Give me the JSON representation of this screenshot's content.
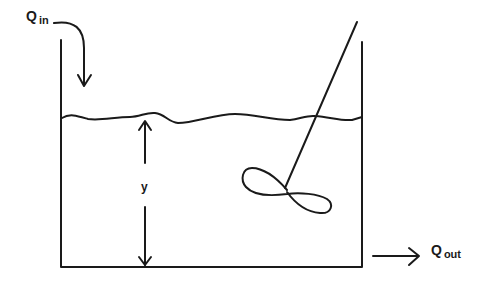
{
  "diagram": {
    "labels": {
      "inflow_main": "Q",
      "inflow_sub": "in",
      "outflow_main": "Q",
      "outflow_sub": "out",
      "height": "y"
    },
    "components": [
      "tank",
      "liquid-surface",
      "inflow-arrow",
      "outflow-arrow",
      "height-dimension-arrow",
      "stirrer-shaft",
      "stirrer-impeller"
    ],
    "colors": {
      "stroke": "#1a1a1a",
      "background": "#ffffff"
    }
  }
}
